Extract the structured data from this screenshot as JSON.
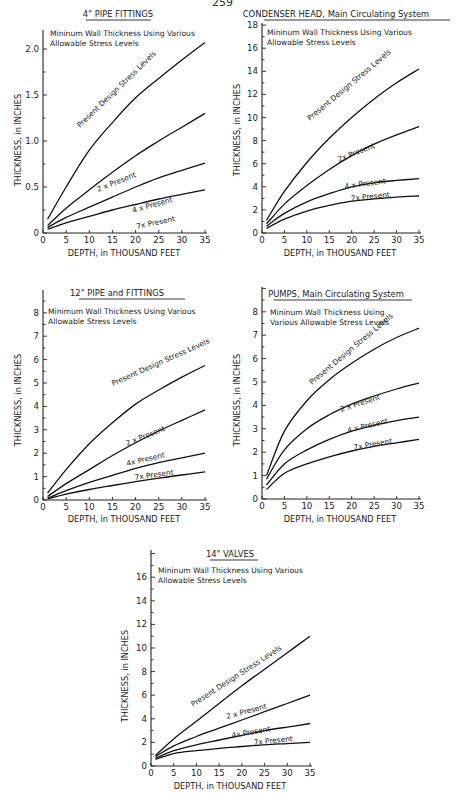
{
  "page": {
    "number": "259"
  },
  "chart_data": [
    {
      "id": "c1",
      "type": "line",
      "title": "4\" PIPE  FITTINGS",
      "subtitle": [
        "Mininum Wall Thickness Using Various",
        "Allowable Stress Levels"
      ],
      "xlabel": "DEPTH, in THOUSAND FEET",
      "ylabel": "THICKNESS, in INCHES",
      "xlim": [
        0,
        35
      ],
      "ylim": [
        0,
        2.2
      ],
      "xticks": [
        0,
        5,
        10,
        15,
        20,
        25,
        30,
        35
      ],
      "xtick_labels": [
        "0",
        "5",
        "10",
        "15",
        "20",
        "25",
        "30",
        "35"
      ],
      "yticks": [
        0,
        0.5,
        1.0,
        1.5,
        2.0
      ],
      "ytick_labels": [
        "0",
        "0.5",
        "1.0",
        "1.5",
        "2.0"
      ],
      "grid": false,
      "x": [
        1,
        5,
        10,
        15,
        20,
        25,
        30,
        35
      ],
      "series": [
        {
          "name": "Present Design Stress Levels",
          "values": [
            0.15,
            0.5,
            0.9,
            1.2,
            1.47,
            1.68,
            1.88,
            2.07
          ]
        },
        {
          "name": "2 x Present",
          "values": [
            0.08,
            0.27,
            0.47,
            0.66,
            0.84,
            1.0,
            1.15,
            1.3
          ]
        },
        {
          "name": "4 x Present",
          "values": [
            0.06,
            0.17,
            0.28,
            0.39,
            0.5,
            0.6,
            0.68,
            0.76
          ]
        },
        {
          "name": "7x Present",
          "values": [
            0.04,
            0.11,
            0.18,
            0.25,
            0.31,
            0.37,
            0.42,
            0.47
          ]
        }
      ]
    },
    {
      "id": "c2",
      "type": "line",
      "title": "CONDENSER HEAD, Main Circulating System",
      "subtitle": [
        "Mininum Wall Thickness Using Various",
        "Allowable Stress Levels"
      ],
      "xlabel": "DEPTH, in THOUSAND FEET",
      "ylabel": "THICKNESS, in INCHES",
      "xlim": [
        0,
        35
      ],
      "ylim": [
        0,
        18
      ],
      "xticks": [
        0,
        5,
        10,
        15,
        20,
        25,
        30,
        35
      ],
      "xtick_labels": [
        "0",
        "5",
        "10",
        "15",
        "20",
        "25",
        "30",
        "35"
      ],
      "yticks": [
        0,
        2,
        4,
        6,
        8,
        10,
        12,
        14,
        16,
        18
      ],
      "ytick_labels": [
        "0",
        "2",
        "4",
        "6",
        "8",
        "10",
        "12",
        "14",
        "16",
        "18"
      ],
      "grid": false,
      "x": [
        1,
        5,
        10,
        15,
        20,
        25,
        30,
        35
      ],
      "series": [
        {
          "name": "Present Design Stress Levels",
          "values": [
            1.1,
            3.6,
            6.1,
            8.2,
            10.0,
            11.6,
            13.0,
            14.2
          ]
        },
        {
          "name": "2x Present",
          "values": [
            0.8,
            2.5,
            4.1,
            5.5,
            6.7,
            7.7,
            8.5,
            9.2
          ]
        },
        {
          "name": "4 x Present",
          "values": [
            0.6,
            1.7,
            2.7,
            3.4,
            4.0,
            4.35,
            4.55,
            4.7
          ]
        },
        {
          "name": "7x Present",
          "values": [
            0.4,
            1.2,
            1.9,
            2.4,
            2.75,
            2.95,
            3.1,
            3.2
          ]
        }
      ]
    },
    {
      "id": "c3",
      "type": "line",
      "title": "12\" PIPE   and FITTINGS",
      "subtitle": [
        "Minimum Wall Thickness Using Various",
        "Allowable Stress Levels"
      ],
      "xlabel": "DEPTH, in THOUSAND FEET",
      "ylabel": "THICKNESS, in INCHES",
      "xlim": [
        0,
        35
      ],
      "ylim": [
        0,
        9
      ],
      "xticks": [
        0,
        5,
        10,
        15,
        20,
        25,
        30,
        35
      ],
      "xtick_labels": [
        "0",
        "5",
        "10",
        "15",
        "20",
        "25",
        "30",
        "35"
      ],
      "yticks": [
        0,
        1,
        2,
        3,
        4,
        5,
        6,
        7,
        8
      ],
      "ytick_labels": [
        "0",
        "1",
        "2",
        "3",
        "4",
        "5",
        "6",
        "7",
        "8"
      ],
      "grid": false,
      "x": [
        1,
        5,
        10,
        15,
        20,
        25,
        30,
        35
      ],
      "series": [
        {
          "name": "Present Design Stress Levels",
          "values": [
            0.3,
            1.3,
            2.4,
            3.3,
            4.1,
            4.7,
            5.25,
            5.75
          ]
        },
        {
          "name": "2 x Present",
          "values": [
            0.15,
            0.7,
            1.3,
            1.9,
            2.45,
            2.95,
            3.4,
            3.85
          ]
        },
        {
          "name": "4x Present",
          "values": [
            0.08,
            0.4,
            0.75,
            1.05,
            1.35,
            1.6,
            1.8,
            2.0
          ]
        },
        {
          "name": "7x Present",
          "values": [
            0.05,
            0.25,
            0.45,
            0.62,
            0.78,
            0.93,
            1.07,
            1.2
          ]
        }
      ]
    },
    {
      "id": "c4",
      "type": "line",
      "title": "PUMPS, Main Circulating System",
      "subtitle": [
        "Mininum Wall Thickness Using",
        "Various Allowable Stress Levels"
      ],
      "xlabel": "DEPTH, in THOUSAND FEET",
      "ylabel": "THICKNESS, in INCHES",
      "xlim": [
        0,
        35
      ],
      "ylim": [
        0,
        9
      ],
      "xticks": [
        0,
        5,
        10,
        15,
        20,
        25,
        30,
        35
      ],
      "xtick_labels": [
        "0",
        "5",
        "10",
        "15",
        "20",
        "25",
        "30",
        "35"
      ],
      "yticks": [
        0,
        1,
        2,
        3,
        4,
        5,
        6,
        7,
        8
      ],
      "ytick_labels": [
        "0",
        "1",
        "2",
        "3",
        "4",
        "5",
        "6",
        "7",
        "8"
      ],
      "grid": false,
      "x": [
        1,
        5,
        10,
        15,
        20,
        25,
        30,
        35
      ],
      "series": [
        {
          "name": "Present Design Stress Levels",
          "values": [
            1.0,
            2.9,
            4.2,
            5.1,
            5.8,
            6.4,
            6.9,
            7.3
          ]
        },
        {
          "name": "2 x Present",
          "values": [
            0.85,
            2.1,
            3.0,
            3.6,
            4.05,
            4.4,
            4.7,
            4.95
          ]
        },
        {
          "name": "4 x Present",
          "values": [
            0.6,
            1.5,
            2.1,
            2.55,
            2.9,
            3.15,
            3.35,
            3.5
          ]
        },
        {
          "name": "7x Present",
          "values": [
            0.4,
            1.1,
            1.5,
            1.8,
            2.05,
            2.25,
            2.4,
            2.55
          ]
        }
      ]
    },
    {
      "id": "c5",
      "type": "line",
      "title": "14\" VALVES",
      "subtitle": [
        "Mininum Wall Thickness Using Various",
        "Allowable Stress Levels"
      ],
      "xlabel": "DEPTH, in THOUSAND FEET",
      "ylabel": "THICKNESS, in INCHES",
      "xlim": [
        0,
        35
      ],
      "ylim": [
        0,
        18
      ],
      "xticks": [
        0,
        5,
        10,
        15,
        20,
        25,
        30,
        35
      ],
      "xtick_labels": [
        "0",
        "5",
        "10",
        "15",
        "20",
        "25",
        "30",
        "35"
      ],
      "yticks": [
        0,
        2,
        4,
        6,
        8,
        10,
        12,
        14,
        16
      ],
      "ytick_labels": [
        "0",
        "2",
        "4",
        "6",
        "8",
        "10",
        "12",
        "14",
        "16"
      ],
      "grid": false,
      "x": [
        1,
        5,
        10,
        15,
        20,
        25,
        30,
        35
      ],
      "series": [
        {
          "name": "Present Design Stress Levels",
          "values": [
            0.9,
            2.3,
            3.8,
            5.3,
            6.8,
            8.2,
            9.6,
            11.0
          ]
        },
        {
          "name": "2 x Present",
          "values": [
            0.8,
            1.7,
            2.5,
            3.2,
            3.9,
            4.6,
            5.3,
            6.0
          ]
        },
        {
          "name": "4x Present",
          "values": [
            0.65,
            1.3,
            1.8,
            2.2,
            2.6,
            3.0,
            3.3,
            3.6
          ]
        },
        {
          "name": "7x Present",
          "values": [
            0.55,
            1.05,
            1.3,
            1.5,
            1.65,
            1.8,
            1.9,
            2.0
          ]
        }
      ]
    }
  ],
  "layout": {
    "c1": {
      "x0": 43,
      "x35": 205,
      "y0": 233,
      "ytop": 30,
      "ymax": 2.2,
      "title_x": 118,
      "title_y": 17,
      "title_ul": [
        86,
        151
      ],
      "sub_x": 50,
      "sub_y": [
        36,
        46
      ],
      "ylabel_x": 21,
      "ylabel_y": 140,
      "xlabel_x": 124,
      "xlabel_y": 256,
      "label_pos": [
        [
          80,
          128,
          -44
        ],
        [
          98,
          192,
          -22
        ],
        [
          133,
          213,
          -16
        ],
        [
          137,
          229,
          -12
        ]
      ]
    },
    "c2": {
      "x0": 262,
      "x35": 419,
      "y0": 233,
      "ytop": 23,
      "ymax": 18,
      "title_x": 336,
      "title_y": 17,
      "title_ul": [
        264,
        450
      ],
      "sub_x": 267,
      "sub_y": [
        35,
        45
      ],
      "ylabel_x": 240,
      "ylabel_y": 130,
      "xlabel_x": 340,
      "xlabel_y": 256,
      "label_pos": [
        [
          310,
          121,
          -40
        ],
        [
          339,
          162,
          -22
        ],
        [
          345,
          189,
          -8
        ],
        [
          351,
          201,
          -6
        ]
      ]
    },
    "c3": {
      "x0": 43,
      "x35": 205,
      "y0": 500,
      "ytop": 290,
      "ymax": 9,
      "title_x": 117,
      "title_y": 296,
      "title_ul": [
        79,
        185
      ],
      "sub_x": 48,
      "sub_y": [
        314,
        324
      ],
      "ylabel_x": 21,
      "ylabel_y": 400,
      "xlabel_x": 124,
      "xlabel_y": 522,
      "label_pos": [
        [
          113,
          386,
          -24
        ],
        [
          127,
          446,
          -22
        ],
        [
          127,
          466,
          -13
        ],
        [
          135,
          480,
          -8
        ]
      ]
    },
    "c4": {
      "x0": 262,
      "x35": 419,
      "y0": 499,
      "ytop": 287,
      "ymax": 9,
      "title_x": 336,
      "title_y": 297,
      "title_ul": [
        274,
        412
      ],
      "sub_x": 270,
      "sub_y": [
        315,
        325
      ],
      "ylabel_x": 240,
      "ylabel_y": 400,
      "xlabel_x": 340,
      "xlabel_y": 522,
      "label_pos": [
        [
          312,
          385,
          -40
        ],
        [
          341,
          412,
          -18
        ],
        [
          348,
          433,
          -14
        ],
        [
          354,
          450,
          -10
        ]
      ]
    },
    "c5": {
      "x0": 151,
      "x35": 310,
      "y0": 766,
      "ytop": 550,
      "ymax": 18,
      "title_x": 230,
      "title_y": 557,
      "title_ul": [
        210,
        258
      ],
      "sub_x": 158,
      "sub_y": [
        573,
        583
      ],
      "ylabel_x": 128,
      "ylabel_y": 676,
      "xlabel_x": 230,
      "xlabel_y": 789,
      "label_pos": [
        [
          193,
          707,
          -33
        ],
        [
          227,
          719,
          -15
        ],
        [
          232,
          738,
          -10
        ],
        [
          254,
          745,
          -6
        ]
      ]
    }
  }
}
